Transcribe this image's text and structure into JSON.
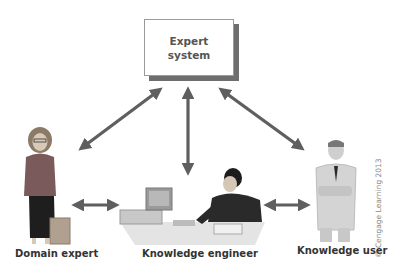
{
  "diagram": {
    "center_node": {
      "label": "Expert\nsystem"
    },
    "people": [
      {
        "id": "domain-expert",
        "label": "Domain expert"
      },
      {
        "id": "knowledge-engineer",
        "label": "Knowledge engineer"
      },
      {
        "id": "knowledge-user",
        "label": "Knowledge user"
      }
    ],
    "connections": [
      {
        "from": "Expert system",
        "to": "Domain expert",
        "type": "bidirectional"
      },
      {
        "from": "Expert system",
        "to": "Knowledge engineer",
        "type": "bidirectional"
      },
      {
        "from": "Expert system",
        "to": "Knowledge user",
        "type": "bidirectional"
      },
      {
        "from": "Domain expert",
        "to": "Knowledge engineer",
        "type": "bidirectional"
      },
      {
        "from": "Knowledge engineer",
        "to": "Knowledge user",
        "type": "bidirectional"
      }
    ],
    "copyright": "© Cengage Learning 2013"
  },
  "colors": {
    "arrow": "#5f5f5f",
    "box_shadow": "#6e6e6e",
    "text": "#333333"
  }
}
